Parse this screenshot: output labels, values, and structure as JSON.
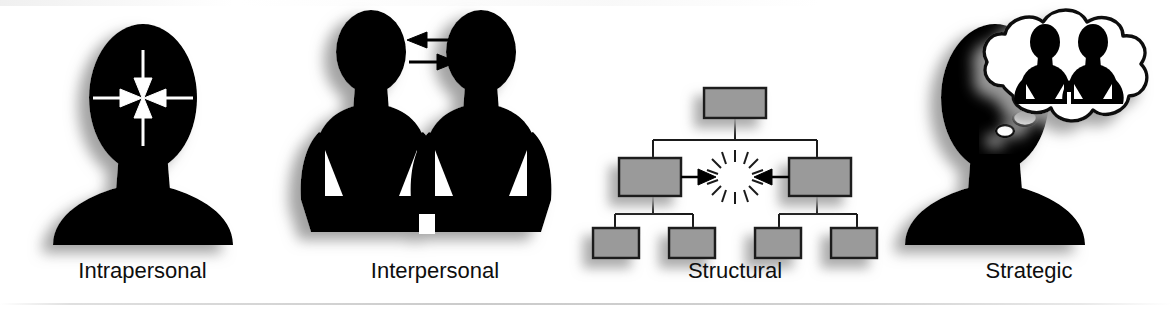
{
  "figure": {
    "background_color": "#ffffff",
    "silhouette_color": "#000000",
    "box_fill_color": "#9a9a9a",
    "box_border_color": "#1a1a1a",
    "label_color": "#0e0e0e",
    "arrow_white_color": "#ffffff",
    "shadow_color": "#b4b4b4"
  },
  "panels": [
    {
      "id": "intrapersonal",
      "label": "Intrapersonal",
      "icon": "head-bust-with-converging-arrows",
      "description": "Head and shoulders silhouette with four white arrows converging toward a point inside the head",
      "arrow_count": 4,
      "arrow_direction": "inward"
    },
    {
      "id": "interpersonal",
      "label": "Interpersonal",
      "icon": "two-people-with-exchange-arrows",
      "description": "Two standing person silhouettes with hands on hips and two opposing arrows between their heads",
      "person_count": 2,
      "arrow_count": 2,
      "arrow_direction": "bidirectional"
    },
    {
      "id": "structural",
      "label": "Structural",
      "icon": "org-chart-with-clash-starburst",
      "description": "Hierarchical org chart of gray boxes with two arrows colliding at a starburst between the two middle boxes",
      "chart_levels": [
        1,
        2,
        4
      ],
      "box_count": 7,
      "arrow_count": 2,
      "arrow_direction": "converging",
      "collision_symbol": "starburst"
    },
    {
      "id": "strategic",
      "label": "Strategic",
      "icon": "head-bust-with-thought-bubble",
      "description": "Head and shoulders silhouette with a cloud thought bubble containing two small person silhouettes",
      "thought_bubble_contents": "two-people",
      "trail_bubble_count": 2
    }
  ]
}
